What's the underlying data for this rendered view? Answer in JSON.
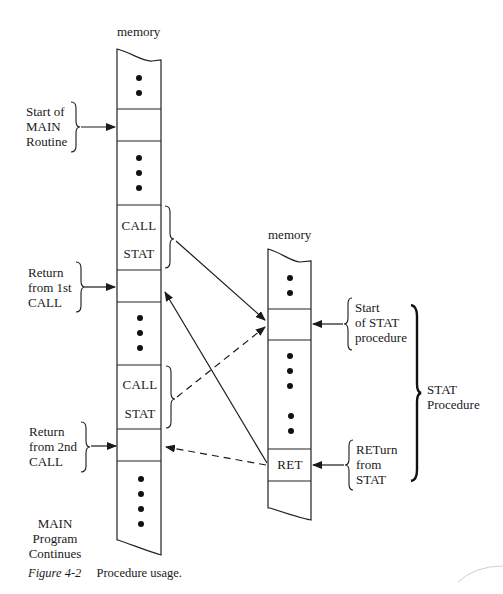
{
  "diagram": {
    "main_memory": {
      "title": "memory",
      "cells": [
        {
          "id": "top-ellipsis",
          "dots": 2
        },
        {
          "id": "main-start",
          "label": ""
        },
        {
          "id": "ellipsis-2",
          "dots": 3
        },
        {
          "id": "call-1",
          "lines": [
            "CALL",
            "STAT"
          ]
        },
        {
          "id": "return-1",
          "label": ""
        },
        {
          "id": "ellipsis-3",
          "dots": 3
        },
        {
          "id": "call-2",
          "lines": [
            "CALL",
            "STAT"
          ]
        },
        {
          "id": "return-2",
          "label": ""
        },
        {
          "id": "bottom-ellipsis",
          "dots": 4
        }
      ]
    },
    "stat_memory": {
      "title": "memory",
      "cells": [
        {
          "id": "top-ellipsis",
          "dots": 2
        },
        {
          "id": "stat-start",
          "label": ""
        },
        {
          "id": "body-ellipsis",
          "dots": 5
        },
        {
          "id": "ret",
          "label": "RET"
        },
        {
          "id": "bottom",
          "label": ""
        }
      ]
    },
    "left_labels": {
      "start_main": [
        "Start of",
        "MAIN",
        "Routine"
      ],
      "return_1": [
        "Return",
        "from 1st",
        "CALL"
      ],
      "return_2": [
        "Return",
        "from 2nd",
        "CALL"
      ],
      "main_continues": [
        "MAIN",
        "Program",
        "Continues"
      ]
    },
    "right_labels": {
      "start_stat": [
        "Start",
        "of STAT",
        "procedure"
      ],
      "return_stat": [
        "RETurn",
        "from",
        "STAT"
      ],
      "stat_procedure": [
        "STAT",
        "Procedure"
      ]
    },
    "arrows": [
      {
        "from": "call-1",
        "to": "stat-start",
        "style": "solid"
      },
      {
        "from": "call-2",
        "to": "stat-start",
        "style": "dashed"
      },
      {
        "from": "ret",
        "to": "return-1",
        "style": "solid"
      },
      {
        "from": "ret",
        "to": "return-2",
        "style": "dashed"
      }
    ]
  },
  "caption": {
    "figure_number": "Figure 4-2",
    "text": "Procedure usage."
  }
}
